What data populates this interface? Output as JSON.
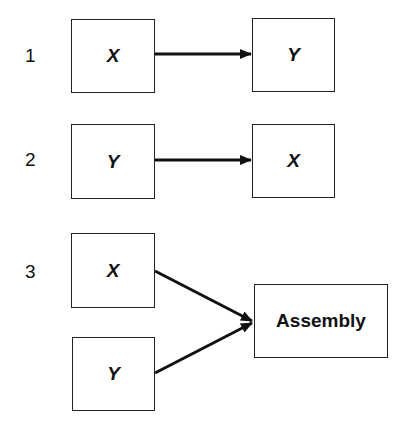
{
  "diagram": {
    "rows": [
      {
        "label": "1",
        "from": [
          "X"
        ],
        "to": "Y"
      },
      {
        "label": "2",
        "from": [
          "Y"
        ],
        "to": "X"
      },
      {
        "label": "3",
        "from": [
          "X",
          "Y"
        ],
        "to": "Assembly"
      }
    ]
  }
}
